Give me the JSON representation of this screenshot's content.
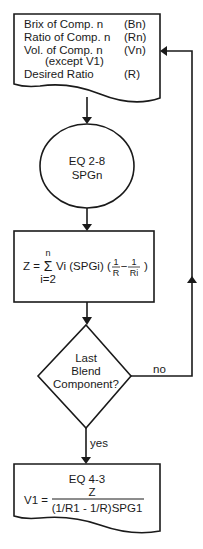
{
  "flowchart": {
    "input_doc": {
      "rows": [
        {
          "label": "Brix of Comp. n",
          "symbol": "(Bn)"
        },
        {
          "label": "Ratio of Comp. n",
          "symbol": "(Rn)"
        },
        {
          "label": "Vol. of Comp. n",
          "symbol": "(Vn)"
        },
        {
          "label": "(except V1)",
          "symbol": ""
        },
        {
          "label": "Desired Ratio",
          "symbol": "(R)"
        }
      ]
    },
    "process_ellipse": {
      "line1": "EQ 2-8",
      "line2": "SPGn"
    },
    "sum_box": {
      "lhs": "Z =",
      "sigma": "Σ",
      "upper": "n",
      "lower": "i=2",
      "body": "Vi (SPGi) (",
      "frac1_num": "1",
      "frac1_den": "R",
      "minus": "−",
      "frac2_num": "1",
      "frac2_den": "Ri",
      "close": ")"
    },
    "decision": {
      "line1": "Last",
      "line2": "Blend",
      "line3": "Component?",
      "no_label": "no",
      "yes_label": "yes"
    },
    "output_doc": {
      "title": "EQ 4-3",
      "lhs": "V1 =",
      "numerator": "Z",
      "denominator": "(1/R1 - 1/R)SPG1"
    }
  }
}
